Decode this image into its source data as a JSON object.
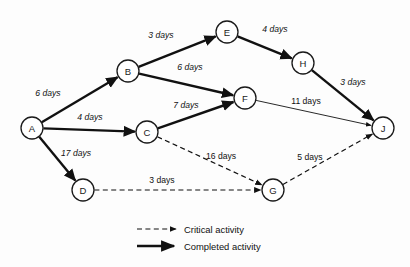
{
  "diagram": {
    "type": "project-network-diagram",
    "title": "",
    "colors": {
      "line": "#111111",
      "node_fill": "#ffffff",
      "background": "#fdfdfd"
    },
    "nodes": [
      {
        "id": "A",
        "label": "A",
        "x": 32,
        "y": 128,
        "r": 11
      },
      {
        "id": "B",
        "label": "B",
        "x": 128,
        "y": 71,
        "r": 11
      },
      {
        "id": "C",
        "label": "C",
        "x": 147,
        "y": 132,
        "r": 11
      },
      {
        "id": "D",
        "label": "D",
        "x": 83,
        "y": 190,
        "r": 11
      },
      {
        "id": "E",
        "label": "E",
        "x": 227,
        "y": 32,
        "r": 11
      },
      {
        "id": "F",
        "label": "F",
        "x": 245,
        "y": 98,
        "r": 11
      },
      {
        "id": "G",
        "label": "G",
        "x": 273,
        "y": 190,
        "r": 11
      },
      {
        "id": "H",
        "label": "H",
        "x": 303,
        "y": 63,
        "r": 11
      },
      {
        "id": "J",
        "label": "J",
        "x": 383,
        "y": 128,
        "r": 11
      }
    ],
    "edges": [
      {
        "id": "A-B",
        "from": "A",
        "to": "B",
        "label": "6 days",
        "days": 6,
        "style": "completed",
        "label_x": 48,
        "label_y": 93,
        "italic": true
      },
      {
        "id": "A-C",
        "from": "A",
        "to": "C",
        "label": "4 days",
        "days": 4,
        "style": "completed",
        "label_x": 90,
        "label_y": 117,
        "italic": true
      },
      {
        "id": "A-D",
        "from": "A",
        "to": "D",
        "label": "17 days",
        "days": 17,
        "style": "completed",
        "label_x": 76,
        "label_y": 153,
        "italic": true
      },
      {
        "id": "B-E",
        "from": "B",
        "to": "E",
        "label": "3 days",
        "days": 3,
        "style": "completed",
        "label_x": 161,
        "label_y": 35,
        "italic": true
      },
      {
        "id": "B-F",
        "from": "B",
        "to": "F",
        "label": "6 days",
        "days": 6,
        "style": "completed",
        "label_x": 190,
        "label_y": 67,
        "italic": true
      },
      {
        "id": "C-F",
        "from": "C",
        "to": "F",
        "label": "7 days",
        "days": 7,
        "style": "completed",
        "label_x": 186,
        "label_y": 105,
        "italic": true
      },
      {
        "id": "E-H",
        "from": "E",
        "to": "H",
        "label": "4 days",
        "days": 4,
        "style": "completed",
        "label_x": 275,
        "label_y": 29,
        "italic": true
      },
      {
        "id": "H-J",
        "from": "H",
        "to": "J",
        "label": "3 days",
        "days": 3,
        "style": "completed",
        "label_x": 353,
        "label_y": 82,
        "italic": true
      },
      {
        "id": "F-J",
        "from": "F",
        "to": "J",
        "label": "11 days",
        "days": 11,
        "style": "thin",
        "label_x": 306,
        "label_y": 101,
        "italic": false
      },
      {
        "id": "C-G",
        "from": "C",
        "to": "G",
        "label": "16 days",
        "days": 16,
        "style": "critical",
        "label_x": 221,
        "label_y": 156,
        "italic": false
      },
      {
        "id": "D-G",
        "from": "D",
        "to": "G",
        "label": "3 days",
        "days": 3,
        "style": "critical",
        "label_x": 162,
        "label_y": 180,
        "italic": false
      },
      {
        "id": "G-J",
        "from": "G",
        "to": "J",
        "label": "5 days",
        "days": 5,
        "style": "critical",
        "label_x": 310,
        "label_y": 157,
        "italic": false
      }
    ],
    "legend": {
      "items": [
        {
          "id": "critical",
          "label": "Critical activity",
          "style": "critical"
        },
        {
          "id": "completed",
          "label": "Completed activity",
          "style": "completed"
        }
      ]
    }
  }
}
